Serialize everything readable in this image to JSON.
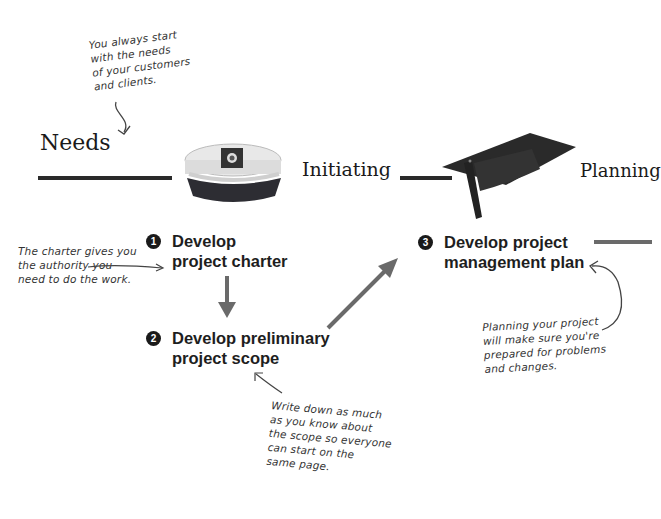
{
  "annotations": {
    "needs_note": [
      "You always start",
      "with the needs",
      "of your customers",
      "and clients."
    ],
    "charter_note": [
      "The charter gives you",
      "the authority you",
      "need to do the work."
    ],
    "scope_note": [
      "Write down as much",
      "as you know about",
      "the scope so everyone",
      "can start on the",
      "same page."
    ],
    "plan_note": [
      "Planning your project",
      "will make sure you're",
      "prepared for problems",
      "and changes."
    ]
  },
  "phases": {
    "needs": "Needs",
    "initiating": "Initiating",
    "planning": "Planning"
  },
  "icons": {
    "initiating": "captain-hat-icon",
    "planning": "graduation-cap-icon"
  },
  "steps": [
    {
      "number": "1",
      "line1": "Develop",
      "line2": "project charter"
    },
    {
      "number": "2",
      "line1": "Develop preliminary",
      "line2": "project scope"
    },
    {
      "number": "3",
      "line1": "Develop project",
      "line2": "management plan"
    }
  ],
  "colors": {
    "line": "#2a2a2a",
    "arrow": "#6a6a6a",
    "text": "#1e1e1e"
  }
}
